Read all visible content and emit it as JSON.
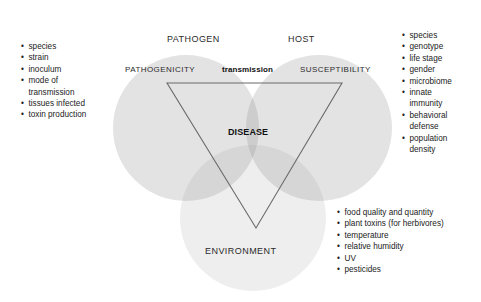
{
  "diagram": {
    "title_visible": false,
    "circles": [
      {
        "name": "pathogen",
        "label": "PATHOGEN",
        "cx": 186,
        "cy": 128,
        "r": 73,
        "fill": "#d8d8d8"
      },
      {
        "name": "host",
        "label": "HOST",
        "cx": 319,
        "cy": 128,
        "r": 73,
        "fill": "#d4d4d4"
      },
      {
        "name": "environment",
        "label": "ENVIRONMENT",
        "cx": 253,
        "cy": 218,
        "r": 73,
        "fill": "#e6e6e6"
      }
    ],
    "triangle": {
      "name": "disease-triangle",
      "points": "167,83 342,83 256,228",
      "stroke": "#6b6b6b",
      "stroke_width": 1.1
    },
    "labels": {
      "pathogen": "PATHOGEN",
      "host": "HOST",
      "environment": "ENVIRONMENT",
      "pathogenicity": "PATHOGENICITY",
      "transmission": "transmission",
      "susceptibility": "SUSCEPTIBILITY",
      "disease": "DISEASE"
    },
    "colors": {
      "circle_light": "#dcdcdc",
      "circle_env": "#e8e8e8",
      "triangle_stroke": "#6b6b6b",
      "text": "#222222",
      "background": "#ffffff"
    }
  },
  "lists": {
    "pathogen": {
      "name": "pathogen-factors",
      "bullet": "•",
      "items": [
        "species",
        "strain",
        "inoculum",
        "mode of\ntransmission",
        "tissues infected",
        "toxin production"
      ]
    },
    "host": {
      "name": "host-factors",
      "bullet": "•",
      "items": [
        "species",
        "genotype",
        "life stage",
        "gender",
        "microbiome",
        "innate\nimmunity",
        "behavioral\ndefense",
        "population\ndensity"
      ]
    },
    "environment": {
      "name": "environment-factors",
      "bullet": "•",
      "items": [
        "food quality and quantity",
        "plant toxins (for herbivores)",
        "temperature",
        "relative humidity",
        "UV",
        "pesticides"
      ]
    }
  }
}
